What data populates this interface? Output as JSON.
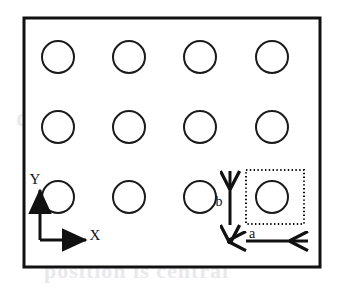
{
  "figure": {
    "frame": {
      "name": "substrate-outline",
      "x": 24,
      "y": 18,
      "width": 296,
      "height": 249,
      "stroke_color": "#111111",
      "stroke_width": 3,
      "fill_color": "#ffffff"
    },
    "holes": {
      "name": "hole-array",
      "rows": 3,
      "columns": 4,
      "radius": 16,
      "stroke_color": "#1a1a1a",
      "stroke_width": 2,
      "fill_color": "#ffffff",
      "x_centers": [
        58,
        129,
        200,
        272
      ],
      "y_centers": [
        57,
        127,
        197
      ],
      "positions": [
        {
          "col": 1,
          "row": 1,
          "cx": 58,
          "cy": 57
        },
        {
          "col": 2,
          "row": 1,
          "cx": 129,
          "cy": 57
        },
        {
          "col": 3,
          "row": 1,
          "cx": 200,
          "cy": 57
        },
        {
          "col": 4,
          "row": 1,
          "cx": 272,
          "cy": 57
        },
        {
          "col": 1,
          "row": 2,
          "cx": 58,
          "cy": 127
        },
        {
          "col": 2,
          "row": 2,
          "cx": 129,
          "cy": 127
        },
        {
          "col": 3,
          "row": 2,
          "cx": 200,
          "cy": 127
        },
        {
          "col": 4,
          "row": 2,
          "cx": 272,
          "cy": 127
        },
        {
          "col": 1,
          "row": 3,
          "cx": 58,
          "cy": 197
        },
        {
          "col": 2,
          "row": 3,
          "cx": 129,
          "cy": 197
        },
        {
          "col": 3,
          "row": 3,
          "cx": 200,
          "cy": 197
        },
        {
          "col": 4,
          "row": 3,
          "cx": 272,
          "cy": 197
        }
      ]
    },
    "unit_cell": {
      "name": "unit-cell-box",
      "x": 246,
      "y": 170,
      "width": 58,
      "height": 54,
      "stroke_color": "#111111",
      "stroke_style": "dotted",
      "encloses_hole": {
        "cx": 272,
        "cy": 197
      }
    },
    "axes": {
      "name": "coordinate-axes",
      "origin": {
        "x": 40,
        "y": 240
      },
      "stroke_color": "#111111",
      "stroke_width": 3,
      "x_axis": {
        "label": "X",
        "from": {
          "x": 40,
          "y": 240
        },
        "to": {
          "x": 88,
          "y": 240
        },
        "label_x": 92,
        "label_y": 239,
        "direction": "right"
      },
      "y_axis": {
        "label": "Y",
        "from": {
          "x": 40,
          "y": 240
        },
        "to": {
          "x": 40,
          "y": 188
        },
        "label_x": 36,
        "label_y": 180,
        "direction": "up"
      }
    },
    "dimensions": [
      {
        "name": "pitch-y-arrow",
        "label": "b",
        "orientation": "vertical",
        "from": {
          "x": 230,
          "y": 228
        },
        "to": {
          "x": 230,
          "y": 168
        },
        "label_x": 220,
        "label_y": 202,
        "stroke_color": "#111111",
        "stroke_width": 3,
        "meaning": "vertical lattice period"
      },
      {
        "name": "pitch-x-arrow",
        "label": "a",
        "orientation": "horizontal",
        "from": {
          "x": 243,
          "y": 241
        },
        "to": {
          "x": 311,
          "y": 241
        },
        "label_x": 250,
        "label_y": 236,
        "stroke_color": "#111111",
        "stroke_width": 3,
        "meaning": "horizontal lattice period"
      }
    ],
    "background_ghost_text": {
      "name": "scan-bleedthrough-text",
      "visible": true,
      "line_1": "d lens  focus  enti",
      "line_2": "position is central",
      "line_3": "region of interest"
    }
  }
}
